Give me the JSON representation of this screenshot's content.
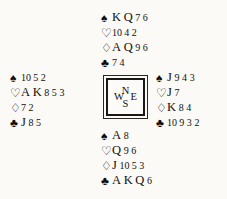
{
  "diagram": {
    "kind": "bridge-hand-diagram",
    "suit_symbols": {
      "spades": "♠",
      "hearts": "♡",
      "diamonds": "♢",
      "clubs": "♣"
    },
    "compass": {
      "north": "N",
      "south": "S",
      "west": "W",
      "east": "E"
    },
    "hands": {
      "north": {
        "label": "North",
        "suits": [
          {
            "suit": "spades",
            "symbol": "♠",
            "filled": true,
            "cards": "K Q 7 6",
            "tokens": [
              "K",
              "Q",
              "7",
              "6"
            ]
          },
          {
            "suit": "hearts",
            "symbol": "♡",
            "filled": false,
            "cards": "10 4 2",
            "tokens": [
              "10",
              "4",
              "2"
            ]
          },
          {
            "suit": "diamonds",
            "symbol": "♢",
            "filled": false,
            "cards": "A Q 9 6",
            "tokens": [
              "A",
              "Q",
              "9",
              "6"
            ]
          },
          {
            "suit": "clubs",
            "symbol": "♣",
            "filled": true,
            "cards": "7 4",
            "tokens": [
              "7",
              "4"
            ]
          }
        ]
      },
      "west": {
        "label": "West",
        "suits": [
          {
            "suit": "spades",
            "symbol": "♠",
            "filled": true,
            "cards": "10 5 2",
            "tokens": [
              "10",
              "5",
              "2"
            ]
          },
          {
            "suit": "hearts",
            "symbol": "♡",
            "filled": false,
            "cards": "A K 8 5 3",
            "tokens": [
              "A",
              "K",
              "8",
              "5",
              "3"
            ]
          },
          {
            "suit": "diamonds",
            "symbol": "♢",
            "filled": false,
            "cards": "7 2",
            "tokens": [
              "7",
              "2"
            ]
          },
          {
            "suit": "clubs",
            "symbol": "♣",
            "filled": true,
            "cards": "J 8 5",
            "tokens": [
              "J",
              "8",
              "5"
            ]
          }
        ]
      },
      "east": {
        "label": "East",
        "suits": [
          {
            "suit": "spades",
            "symbol": "♠",
            "filled": true,
            "cards": "J 9 4 3",
            "tokens": [
              "J",
              "9",
              "4",
              "3"
            ]
          },
          {
            "suit": "hearts",
            "symbol": "♡",
            "filled": false,
            "cards": "J 7",
            "tokens": [
              "J",
              "7"
            ]
          },
          {
            "suit": "diamonds",
            "symbol": "♢",
            "filled": false,
            "cards": "K 8 4",
            "tokens": [
              "K",
              "8",
              "4"
            ]
          },
          {
            "suit": "clubs",
            "symbol": "♣",
            "filled": true,
            "cards": "10 9 3 2",
            "tokens": [
              "10",
              "9",
              "3",
              "2"
            ]
          }
        ]
      },
      "south": {
        "label": "South",
        "suits": [
          {
            "suit": "spades",
            "symbol": "♠",
            "filled": true,
            "cards": "A 8",
            "tokens": [
              "A",
              "8"
            ]
          },
          {
            "suit": "hearts",
            "symbol": "♡",
            "filled": false,
            "cards": "Q 9 6",
            "tokens": [
              "Q",
              "9",
              "6"
            ]
          },
          {
            "suit": "diamonds",
            "symbol": "♢",
            "filled": false,
            "cards": "J 10 5 3",
            "tokens": [
              "J",
              "10",
              "5",
              "3"
            ]
          },
          {
            "suit": "clubs",
            "symbol": "♣",
            "filled": true,
            "cards": "A K Q 6",
            "tokens": [
              "A",
              "K",
              "Q",
              "6"
            ]
          }
        ]
      }
    }
  }
}
